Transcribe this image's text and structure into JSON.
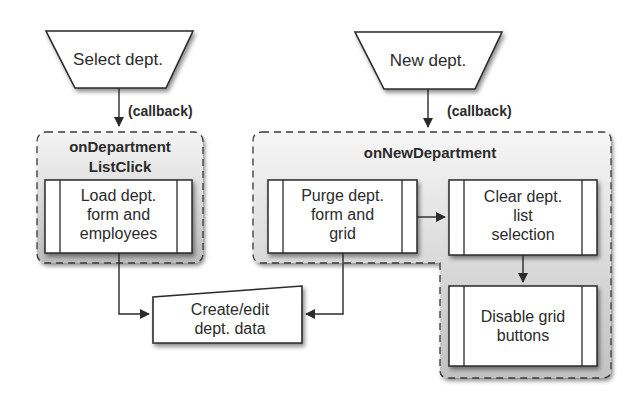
{
  "diagram": {
    "type": "flowchart",
    "nodes": {
      "select_dept": {
        "label": "Select dept.",
        "shape": "manual-input-trapezoid"
      },
      "new_dept": {
        "label": "New dept.",
        "shape": "manual-input-trapezoid"
      },
      "callback_left": {
        "label": "(callback)"
      },
      "callback_right": {
        "label": "(callback)"
      },
      "group_left": {
        "title_line1": "onDepartment",
        "title_line2": "ListClick"
      },
      "group_right": {
        "title": "onNewDepartment"
      },
      "load_dept": {
        "line1": "Load dept.",
        "line2": "form and",
        "line3": "employees",
        "shape": "predefined-process"
      },
      "purge_dept": {
        "line1": "Purge dept.",
        "line2": "form and",
        "line3": "grid",
        "shape": "predefined-process"
      },
      "clear_dept": {
        "line1": "Clear dept.",
        "line2": "list",
        "line3": "selection",
        "shape": "predefined-process"
      },
      "disable_grid": {
        "line1": "Disable grid",
        "line2": "buttons",
        "shape": "predefined-process"
      },
      "create_edit": {
        "line1": "Create/edit",
        "line2": "dept. data",
        "shape": "manual-input"
      }
    },
    "edges": [
      {
        "from": "select_dept",
        "to": "group_left",
        "label": "(callback)"
      },
      {
        "from": "new_dept",
        "to": "group_right",
        "label": "(callback)"
      },
      {
        "from": "load_dept",
        "to": "create_edit"
      },
      {
        "from": "purge_dept",
        "to": "clear_dept"
      },
      {
        "from": "clear_dept",
        "to": "disable_grid"
      },
      {
        "from": "purge_dept",
        "to": "create_edit"
      }
    ],
    "colors": {
      "stroke": "#2a2a2a",
      "group_fill_top": "#f2f2f2",
      "group_fill_bottom": "#c4c4c4",
      "box_fill": "#ffffff"
    }
  }
}
